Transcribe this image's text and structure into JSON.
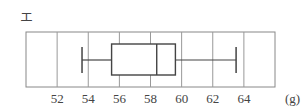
{
  "panel_label": "エ",
  "chart_data": {
    "type": "boxplot",
    "title": "",
    "xlabel": "(g)",
    "ylabel": "",
    "xlim": [
      50,
      66
    ],
    "x_ticks": [
      52,
      54,
      56,
      58,
      60,
      62,
      64
    ],
    "tick_labels": [
      "52",
      "54",
      "56",
      "58",
      "60",
      "62",
      "64"
    ],
    "unit_label": "(g)",
    "grid": true,
    "orientation": "horizontal",
    "box": {
      "min": 53.6,
      "q1": 55.5,
      "median": 58.4,
      "q3": 59.6,
      "max": 63.5
    }
  }
}
